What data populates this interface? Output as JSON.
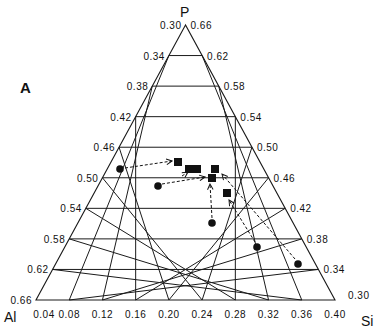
{
  "panel_label": "A",
  "vertices": {
    "top": "P",
    "left": "Al",
    "right": "Si"
  },
  "axes": {
    "left_ticks": [
      "0.30",
      "0.34",
      "0.38",
      "0.42",
      "0.46",
      "0.50",
      "0.54",
      "0.58",
      "0.62",
      "0.66"
    ],
    "right_ticks": [
      "0.66",
      "0.62",
      "0.58",
      "0.54",
      "0.50",
      "0.46",
      "0.42",
      "0.38",
      "0.34",
      "0.30"
    ],
    "bottom_ticks": [
      "0.04",
      "0.08",
      "0.12",
      "0.16",
      "0.20",
      "0.24",
      "0.28",
      "0.32",
      "0.36",
      "0.40"
    ]
  },
  "colors": {
    "line": "#1a1a1a",
    "marker": "#111111",
    "background": "#ffffff"
  },
  "chart_data": {
    "type": "ternary",
    "title": "",
    "components": [
      "P",
      "Al",
      "Si"
    ],
    "ranges": {
      "P": [
        0.3,
        0.66
      ],
      "Al": [
        0.3,
        0.66
      ],
      "Si": [
        0.04,
        0.4
      ]
    },
    "grid_step": 0.04,
    "legend": [],
    "series": [
      {
        "name": "circles",
        "marker": "circle",
        "points": [
          {
            "x": 120,
            "y": 169
          },
          {
            "x": 158,
            "y": 186
          },
          {
            "x": 212,
            "y": 223
          },
          {
            "x": 257,
            "y": 247
          },
          {
            "x": 298,
            "y": 264
          }
        ]
      },
      {
        "name": "squares",
        "marker": "square",
        "points": [
          {
            "x": 178,
            "y": 162
          },
          {
            "x": 189,
            "y": 169
          },
          {
            "x": 197,
            "y": 169
          },
          {
            "x": 215,
            "y": 169
          },
          {
            "x": 212,
            "y": 178
          },
          {
            "x": 227,
            "y": 193
          }
        ]
      }
    ],
    "arrows": [
      {
        "from": [
          125,
          168
        ],
        "to": [
          172,
          161
        ]
      },
      {
        "from": [
          162,
          184
        ],
        "to": [
          205,
          177
        ]
      },
      {
        "from": [
          182,
          176
        ],
        "to": [
          188,
          172
        ]
      },
      {
        "from": [
          212,
          218
        ],
        "to": [
          210,
          184
        ]
      },
      {
        "from": [
          255,
          242
        ],
        "to": [
          229,
          200
        ]
      },
      {
        "from": [
          295,
          259
        ],
        "to": [
          222,
          174
        ]
      }
    ]
  }
}
